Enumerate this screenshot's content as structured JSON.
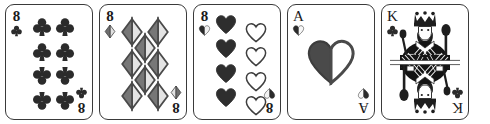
{
  "scene": {
    "title": "Five playing cards in a row",
    "background_color": "#ffffff",
    "card_count": 5,
    "card_face_color": "#ffffff",
    "card_border_color": "#3a3a3a",
    "ink_color": "#1b1b1b",
    "pip_fill_dark": "#2b2b2b",
    "pip_fill_light": "#d8d8d8",
    "pip_outline": "#444444",
    "color_mode": "grayscale"
  },
  "cards": [
    {
      "id": "card-1",
      "name": "eight-of-clubs",
      "rank": "8",
      "suit": "clubs",
      "suit_symbol": "♣",
      "label": "8 of Clubs",
      "type": "number",
      "pip_count": 8,
      "layout": "two-columns-of-four",
      "corner_top_left": "8",
      "corner_bottom_right": "8"
    },
    {
      "id": "card-2",
      "name": "eight-of-diamonds",
      "rank": "8",
      "suit": "diamonds",
      "suit_symbol": "♦",
      "label": "8 of Diamonds",
      "type": "number",
      "pip_count": 8,
      "layout": "staggered-2-1-2-1-2",
      "corner_top_left": "8",
      "corner_bottom_right": "8"
    },
    {
      "id": "card-3",
      "name": "eight-of-hearts",
      "rank": "8",
      "suit": "hearts",
      "suit_symbol": "♥",
      "label": "8 of Hearts",
      "type": "number",
      "pip_count": 8,
      "layout": "two-columns-of-four-offset",
      "corner_top_left": "8",
      "corner_bottom_right": "8"
    },
    {
      "id": "card-4",
      "name": "ace-of-hearts",
      "rank": "A",
      "suit": "hearts",
      "suit_symbol": "♥",
      "label": "Ace of Hearts",
      "type": "ace",
      "pip_count": 1,
      "layout": "single-large-center",
      "corner_top_left": "A",
      "corner_bottom_right": "A"
    },
    {
      "id": "card-5",
      "name": "king-of-clubs",
      "rank": "K",
      "suit": "clubs",
      "suit_symbol": "♣",
      "label": "King of Clubs",
      "type": "court",
      "pip_count": 0,
      "layout": "double-headed-court-figure",
      "corner_top_left": "K",
      "corner_bottom_right": "K"
    }
  ]
}
